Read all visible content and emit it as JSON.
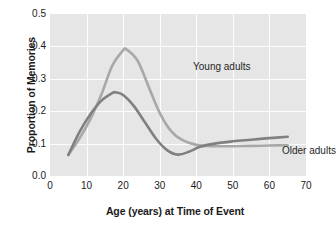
{
  "chart_data": {
    "type": "line",
    "title": "",
    "xlabel": "Age (years) at Time of Event",
    "ylabel": "Proportion of Memories",
    "xlim": [
      0,
      70
    ],
    "ylim": [
      0.0,
      0.5
    ],
    "xticks": [
      "0",
      "10",
      "20",
      "30",
      "40",
      "50",
      "60",
      "70"
    ],
    "xtick_values": [
      0,
      10,
      20,
      30,
      40,
      50,
      60,
      70
    ],
    "yticks": [
      "0.0",
      "0.1",
      "0.2",
      "0.3",
      "0.4",
      "0.5"
    ],
    "ytick_values": [
      0.0,
      0.1,
      0.2,
      0.3,
      0.4,
      0.5
    ],
    "grid": "both",
    "legend_position": "inline-annotations",
    "plot_background": "#e6e6e6",
    "gridline_color": "#fdfdfd",
    "series": [
      {
        "name": "Young adults",
        "color": "#a8a8a8",
        "x": [
          5,
          8,
          11,
          14,
          17,
          20,
          21,
          24,
          27,
          30,
          33,
          36,
          40,
          45,
          50,
          55,
          60,
          65
        ],
        "values": [
          0.065,
          0.115,
          0.175,
          0.25,
          0.34,
          0.388,
          0.39,
          0.355,
          0.275,
          0.195,
          0.14,
          0.112,
          0.096,
          0.092,
          0.092,
          0.093,
          0.094,
          0.095
        ]
      },
      {
        "name": "Older adults",
        "color": "#808080",
        "x": [
          5,
          8,
          11,
          14,
          17,
          18,
          20,
          23,
          26,
          29,
          32,
          35,
          38,
          41,
          45,
          50,
          55,
          60,
          65
        ],
        "values": [
          0.065,
          0.135,
          0.19,
          0.232,
          0.256,
          0.258,
          0.25,
          0.215,
          0.165,
          0.115,
          0.08,
          0.066,
          0.075,
          0.09,
          0.1,
          0.107,
          0.112,
          0.117,
          0.121
        ]
      }
    ],
    "annotations": [
      {
        "text": "Young adults",
        "x": 25,
        "y": 0.37
      },
      {
        "text": "Older adults",
        "x": 50,
        "y": 0.155
      }
    ]
  }
}
